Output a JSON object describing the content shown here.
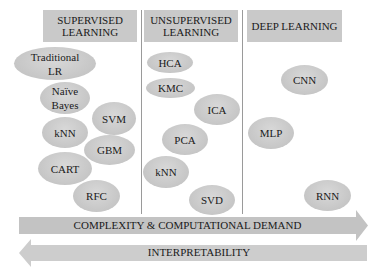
{
  "columns": [
    {
      "title": "SUPERVISED LEARNING",
      "title_lines": [
        "SUPERVISED",
        "LEARNING"
      ]
    },
    {
      "title": "UNSUPERVISED LEARNING",
      "title_lines": [
        "UNSUPERVISED",
        "LEARNING"
      ]
    },
    {
      "title": "DEEP LEARNING",
      "title_lines": [
        "DEEP LEARNING"
      ]
    }
  ],
  "supervised": {
    "items": [
      {
        "label_lines": [
          "Traditional",
          "LR"
        ]
      },
      {
        "label_lines": [
          "Naïve",
          "Bayes"
        ]
      },
      {
        "label_lines": [
          "SVM"
        ]
      },
      {
        "label_lines": [
          "kNN"
        ]
      },
      {
        "label_lines": [
          "GBM"
        ]
      },
      {
        "label_lines": [
          "CART"
        ]
      },
      {
        "label_lines": [
          "RFC"
        ]
      }
    ]
  },
  "unsupervised": {
    "items": [
      {
        "label": "HCA"
      },
      {
        "label": "KMC"
      },
      {
        "label": "ICA"
      },
      {
        "label": "PCA"
      },
      {
        "label": "kNN"
      },
      {
        "label": "SVD"
      }
    ]
  },
  "deep": {
    "items": [
      {
        "label": "CNN"
      },
      {
        "label": "MLP"
      },
      {
        "label": "RNN"
      }
    ]
  },
  "arrows": {
    "complexity": {
      "label": "COMPLEXITY & COMPUTATIONAL DEMAND",
      "direction": "right"
    },
    "interpretability": {
      "label": "INTERPRETABILITY",
      "direction": "left"
    }
  },
  "colors": {
    "header_fill": "#c9c9c9",
    "ellipse_fill": "#c6c6c6",
    "arrow_fill": "#c3c3c3",
    "divider": "#9a9a9a"
  }
}
